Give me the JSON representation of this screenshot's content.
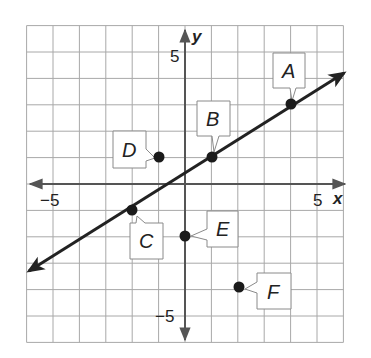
{
  "chart_data": {
    "type": "scatter",
    "title": "",
    "xlabel": "x",
    "ylabel": "y",
    "xlim": [
      -6,
      6
    ],
    "ylim": [
      -6,
      6
    ],
    "grid": true,
    "tick_labels": {
      "x": [
        "−5",
        "5"
      ],
      "y": [
        "5",
        "−5"
      ]
    },
    "line": {
      "slope": 0.6667,
      "intercept": 0.3333,
      "through": [
        [
          -2,
          -1
        ],
        [
          1,
          1
        ],
        [
          4,
          3
        ]
      ],
      "arrows": "both"
    },
    "points": [
      {
        "label": "A",
        "x": 4,
        "y": 3,
        "on_line": true
      },
      {
        "label": "B",
        "x": 1,
        "y": 1,
        "on_line": true
      },
      {
        "label": "C",
        "x": -2,
        "y": -1,
        "on_line": true
      },
      {
        "label": "D",
        "x": -1,
        "y": 1,
        "on_line": false
      },
      {
        "label": "E",
        "x": 0,
        "y": -2,
        "on_line": false
      },
      {
        "label": "F",
        "x": 2,
        "y": -4,
        "on_line": false
      }
    ]
  },
  "axes": {
    "x_name": "x",
    "y_name": "y",
    "x_neg_label": "−5",
    "x_pos_label": "5",
    "y_pos_label": "5",
    "y_neg_label": "−5"
  },
  "labels": {
    "A": "A",
    "B": "B",
    "C": "C",
    "D": "D",
    "E": "E",
    "F": "F"
  },
  "colors": {
    "grid": "#a8a8a8",
    "axis": "#555555",
    "line": "#222222",
    "point": "#1a1a1a",
    "box_stroke": "#8a8a8a"
  }
}
